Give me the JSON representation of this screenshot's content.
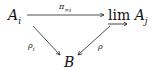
{
  "diagram": {
    "type": "commutative-diagram",
    "nodes": {
      "top_left": {
        "base": "A",
        "sub": "i"
      },
      "top_right": {
        "operator": "lim",
        "base": "A",
        "sub": "j"
      },
      "bottom": {
        "base": "B"
      }
    },
    "arrows": {
      "top": {
        "from": "A_i",
        "to": "lim A_j",
        "label_base": "π",
        "label_sub": "∞i"
      },
      "left": {
        "from": "A_i",
        "to": "B",
        "label_base": "ρ",
        "label_sub": "i"
      },
      "right": {
        "from": "lim A_j",
        "to": "B",
        "label_base": "ρ"
      }
    }
  }
}
